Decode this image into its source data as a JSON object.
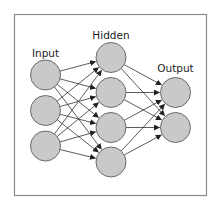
{
  "diagram": {
    "frame": {
      "x": 14.5,
      "y": 14.5,
      "w": 192,
      "h": 181,
      "stroke": "#8a8a8a"
    },
    "node_style": {
      "fill": "#c9c9c9",
      "stroke": "#6a6a6a",
      "radius": 15
    },
    "edge_color": "#333333",
    "layers": [
      {
        "name": "input",
        "label": "Input",
        "label_x": 45.5,
        "label_y": 57,
        "x": 45.5,
        "nodes": [
          75,
          110.5,
          146
        ]
      },
      {
        "name": "hidden",
        "label": "Hidden",
        "label_x": 111,
        "label_y": 39,
        "x": 111,
        "nodes": [
          57.5,
          92.5,
          127.5,
          162
        ]
      },
      {
        "name": "output",
        "label": "Output",
        "label_x": 175.5,
        "label_y": 72,
        "x": 175.5,
        "nodes": [
          92.5,
          127.5
        ]
      }
    ],
    "connections": "fully-connected"
  }
}
